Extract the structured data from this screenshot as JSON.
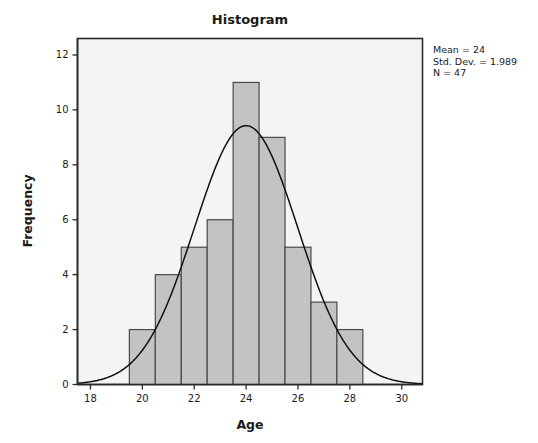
{
  "chart_data": {
    "type": "bar",
    "title": "Histogram",
    "xlabel": "Age",
    "ylabel": "Frequency",
    "categories": [
      20,
      21,
      22,
      23,
      24,
      25,
      26,
      27,
      28
    ],
    "values": [
      2,
      4,
      5,
      6,
      11,
      9,
      5,
      3,
      2
    ],
    "bin_width": 1,
    "xlim": [
      17.5,
      30.8
    ],
    "ylim": [
      0,
      12.6
    ],
    "xticks": [
      18,
      20,
      22,
      24,
      26,
      28,
      30
    ],
    "yticks": [
      0,
      2,
      4,
      6,
      8,
      10,
      12
    ],
    "xtick_labels": [
      "18",
      "20",
      "22",
      "24",
      "26",
      "28",
      "30"
    ],
    "ytick_labels": [
      "0",
      "2",
      "4",
      "6",
      "8",
      "10",
      "12"
    ],
    "grid": false,
    "legend": "none",
    "overlay": {
      "type": "normal-curve",
      "mean": 24,
      "std_dev": 1.989,
      "n": 47,
      "peak_value": 9.43
    }
  },
  "annotations": {
    "stats": [
      "Mean = 24",
      "Std. Dev. = 1.989",
      "N = 47"
    ]
  },
  "colors": {
    "bar_fill": "#c3c3c3",
    "bar_stroke": "#4a4a4a",
    "plot_background": "#f4f4f4",
    "axis": "#2b2b2b",
    "curve": "#111111",
    "text": "#1a1a1a"
  }
}
